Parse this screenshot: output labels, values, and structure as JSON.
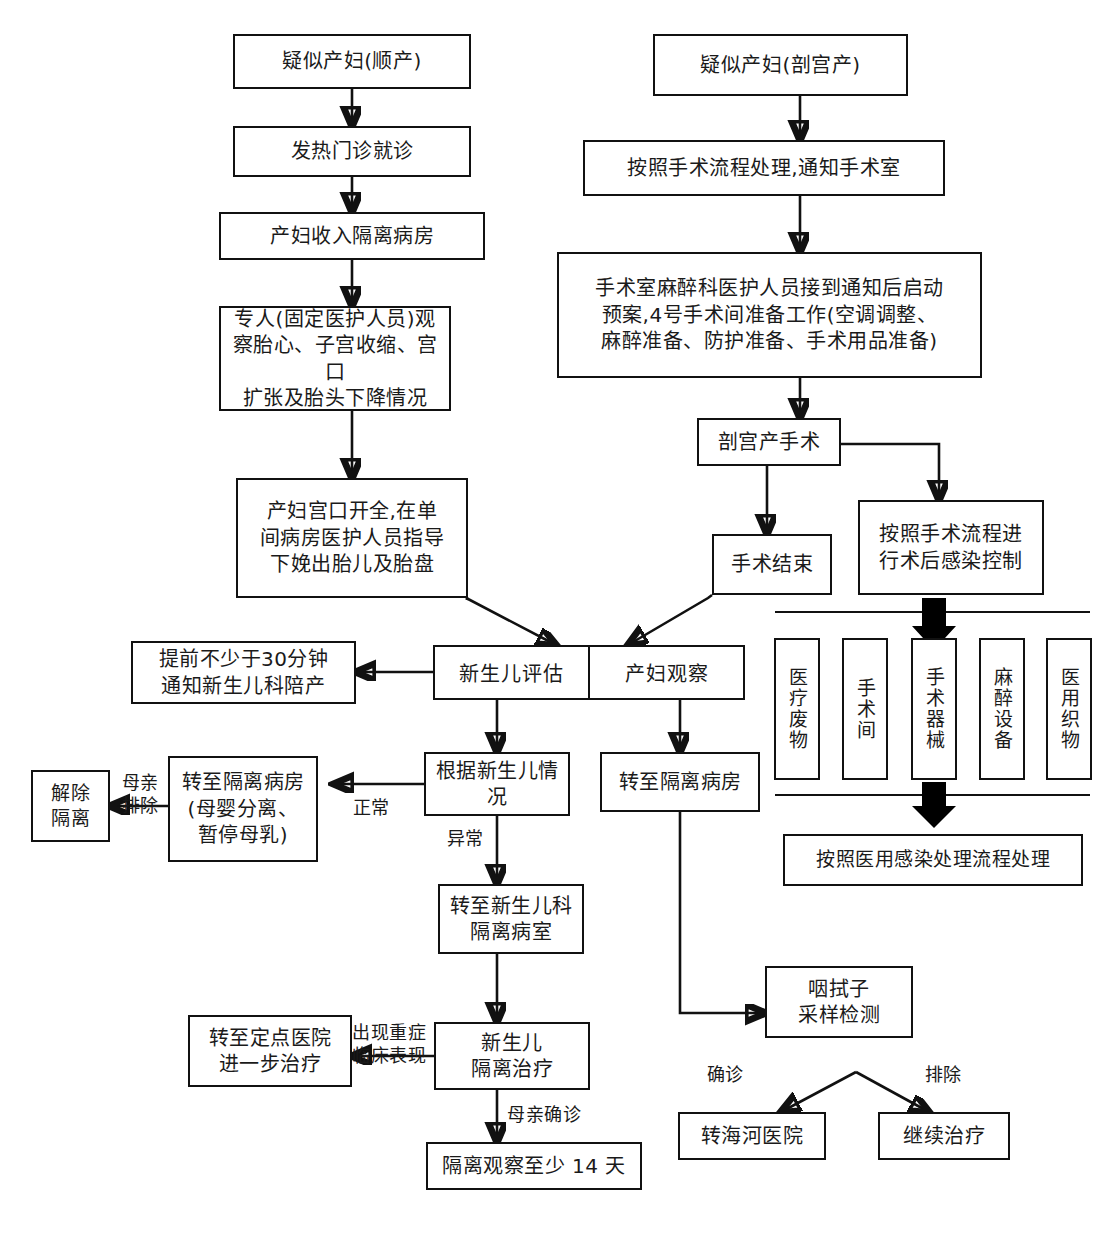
{
  "flow": {
    "type": "flowchart",
    "left_branch": {
      "start": "疑似产妇(顺产)",
      "steps": [
        "发热门诊就诊",
        "产妇收入隔离病房",
        "专人(固定医护人员)观\n察胎心、子宫收缩、宫口\n扩张及胎头下降情况",
        "产妇宫口开全,在单\n间病房医护人员指导\n下娩出胎儿及胎盘"
      ]
    },
    "right_branch": {
      "start": "疑似产妇(剖宫产)",
      "steps": [
        "按照手术流程处理,通知手术室",
        "手术室麻醉科医护人员接到通知后启动\n预案,4号手术间准备工作(空调调整、\n麻醉准备、防护准备、手术用品准备)",
        "剖宫产手术"
      ],
      "after_surgery": "手术结束",
      "infection_control": "按照手术流程进\n行术后感染控制"
    },
    "disinfect_items": [
      "医疗废物",
      "手术间",
      "手术器械",
      "麻醉设备",
      "医用织物"
    ],
    "disinfect_result": "按照医用感染处理流程处理",
    "center": {
      "newborn_eval": "新生儿评估",
      "mother_observe": "产妇观察",
      "notify_pediatrics": "提前不少于30分钟\n通知新生儿科陪产",
      "newborn_condition": "根据新生儿情况",
      "mother_isolation": "转至隔离病房\n(母婴分离、\n暂停母乳)",
      "release_isolation": "解除\n隔离",
      "mother_transfer": "转至隔离病房",
      "newborn_nicu": "转至新生儿科\n隔离病室",
      "newborn_treat": "新生儿\n隔离治疗",
      "transfer_designated": "转至定点医院\n进一步治疗",
      "observe14": "隔离观察至少 14 天",
      "swab_test": "咽拭子\n采样检测",
      "confirmed_target": "转海河医院",
      "excluded_target": "继续治疗"
    },
    "edge_labels": {
      "normal": "正常",
      "abnormal": "异常",
      "mother_excluded": "母亲\n排除",
      "severe_symptoms": "出现重症\n临床表现",
      "mother_confirmed": "母亲确诊",
      "confirmed": "确诊",
      "excluded": "排除"
    }
  }
}
